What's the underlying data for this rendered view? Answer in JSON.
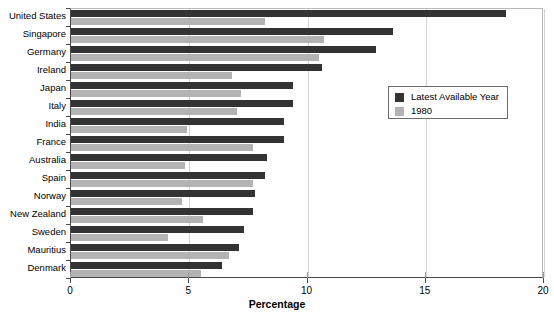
{
  "chart_data": {
    "type": "bar",
    "orientation": "horizontal",
    "title": "",
    "xlabel": "Percentage",
    "ylabel": "",
    "xlim": [
      0,
      20
    ],
    "xticks": [
      0,
      5,
      10,
      15,
      20
    ],
    "xtick_labels": [
      "0",
      "5",
      "10",
      "15",
      "20"
    ],
    "grid": true,
    "legend_position": "upper-right-inside",
    "categories": [
      "United States",
      "Singapore",
      "Germany",
      "Ireland",
      "Japan",
      "Italy",
      "India",
      "France",
      "Australia",
      "Spain",
      "Norway",
      "New Zealand",
      "Sweden",
      "Mauritius",
      "Denmark"
    ],
    "series": [
      {
        "name": "Latest Available Year",
        "color": "#333333",
        "values": [
          18.4,
          13.6,
          12.9,
          10.6,
          9.4,
          9.4,
          9.0,
          9.0,
          8.3,
          8.2,
          7.8,
          7.7,
          7.3,
          7.1,
          6.4
        ]
      },
      {
        "name": "1980",
        "color": "#b3b3b3",
        "values": [
          8.2,
          10.7,
          10.5,
          6.8,
          7.2,
          7.0,
          4.9,
          7.7,
          4.8,
          7.7,
          4.7,
          5.6,
          4.1,
          6.7,
          5.5
        ]
      }
    ]
  },
  "legend": {
    "entries": [
      {
        "label": "Latest Available Year",
        "color": "#333333"
      },
      {
        "label": "1980",
        "color": "#b3b3b3"
      }
    ]
  },
  "axis": {
    "x_title": "Percentage"
  },
  "colors": {
    "latest": "#333333",
    "nineteen_eighty": "#b3b3b3",
    "axis": "#4a4a4a",
    "grid": "#d3d3d3",
    "background": "#ffffff"
  }
}
